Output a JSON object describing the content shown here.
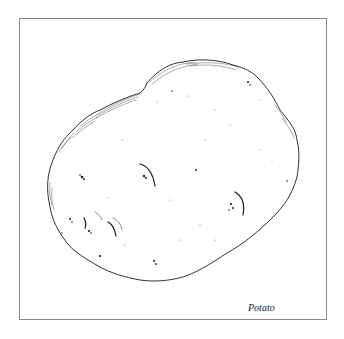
{
  "illustration": {
    "subject": "potato",
    "caption": "Potato",
    "colors": {
      "frame": "#8a8a8a",
      "ink": "#1a1a1a",
      "background": "#ffffff"
    }
  }
}
